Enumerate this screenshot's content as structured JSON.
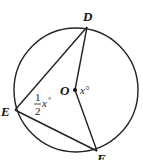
{
  "diagram": {
    "type": "circle-inscribed-angle",
    "points": {
      "D": {
        "label": "D"
      },
      "E": {
        "label": "E"
      },
      "F": {
        "label": "F"
      },
      "O": {
        "label": "O"
      }
    },
    "angles": {
      "central": {
        "at": "O",
        "text": "x°",
        "var": "x",
        "deg": "°"
      },
      "inscribed": {
        "at": "E",
        "num": "1",
        "den": "2",
        "var": "x",
        "deg": "°"
      }
    },
    "segments": [
      "ED",
      "EF",
      "OD",
      "OF"
    ]
  }
}
